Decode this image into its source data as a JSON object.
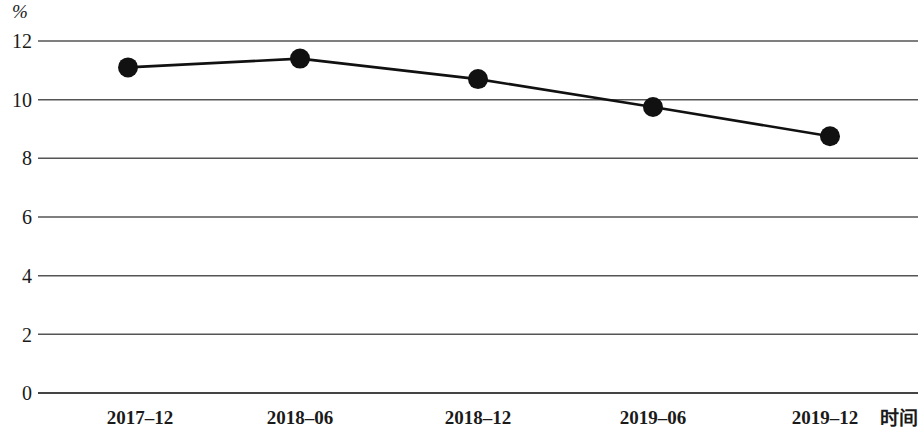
{
  "chart_data": {
    "type": "line",
    "title": "",
    "subtitle": "",
    "unit_label": "%",
    "xlabel": "时间",
    "ylabel": "",
    "categories": [
      "2017–12",
      "2018–06",
      "2018–12",
      "2019–06",
      "2019–12"
    ],
    "values": [
      11.1,
      11.4,
      10.7,
      9.75,
      8.75
    ],
    "series": [
      {
        "name": "",
        "values": [
          11.1,
          11.4,
          10.7,
          9.75,
          8.75
        ]
      }
    ],
    "ylim": [
      0,
      12
    ],
    "ytick_labels": [
      "0",
      "2",
      "4",
      "6",
      "8",
      "10",
      "12"
    ],
    "ytick_values": [
      0,
      2,
      4,
      6,
      8,
      10,
      12
    ],
    "grid": true,
    "grid_axis": "y",
    "legend": "none",
    "marker": "filled-circle",
    "line_color": "#111111",
    "marker_color": "#111111",
    "grid_color": "#555555",
    "background_color": "#ffffff"
  },
  "axis": {
    "unit": "%",
    "x_title": "时间"
  }
}
